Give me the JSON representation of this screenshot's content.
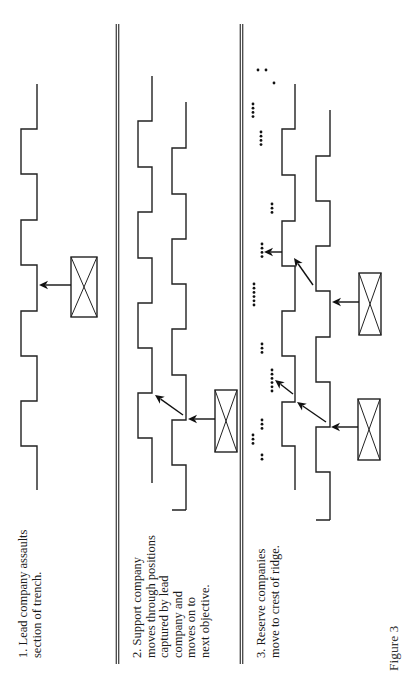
{
  "figure": {
    "label": "Figure 3",
    "colors": {
      "ink": "#222222",
      "background": "#ffffff"
    }
  },
  "panels": [
    {
      "id": 1,
      "caption_lines": [
        "1. Lead company assaults",
        "section of trench."
      ],
      "caption_pos": {
        "x": 17,
        "y": 658
      },
      "trenches": [
        {
          "left_x": 21,
          "right_x": 37,
          "top_y": 84,
          "steps": [
            129,
            174,
            220,
            265,
            311,
            356,
            401,
            446
          ],
          "start_side": "right",
          "end_y": 490,
          "end_stub": null
        }
      ],
      "units": [
        {
          "x": 71,
          "y": 257,
          "w": 26,
          "h": 60
        }
      ],
      "arrows": [
        {
          "x1": 71,
          "y1": 285,
          "x2": 39,
          "y2": 285
        }
      ],
      "dots": []
    },
    {
      "id": 2,
      "caption_lines": [
        "2. Support company",
        "moves through positions",
        "captured by lead",
        "company and",
        "moves on to",
        "next objective."
      ],
      "caption_pos": {
        "x": 131,
        "y": 658
      },
      "trenches": [
        {
          "left_x": 138,
          "right_x": 152,
          "top_y": 76,
          "steps": [
            121,
            167,
            212,
            258,
            303,
            348,
            393,
            438
          ],
          "start_side": "right",
          "end_y": 483,
          "end_stub": null
        },
        {
          "left_x": 172,
          "right_x": 186,
          "top_y": 102,
          "steps": [
            148,
            194,
            239,
            284,
            329,
            375,
            420,
            465,
            510
          ],
          "start_side": "right",
          "end_y": 557,
          "end_stub": "right"
        }
      ],
      "units": [
        {
          "x": 215,
          "y": 390,
          "w": 22,
          "h": 62
        }
      ],
      "arrows": [
        {
          "x1": 215,
          "y1": 419,
          "x2": 188,
          "y2": 419
        },
        {
          "x1": 183,
          "y1": 415,
          "x2": 155,
          "y2": 395
        }
      ],
      "dots": []
    },
    {
      "id": 3,
      "caption_lines": [
        "3. Reserve companies",
        "move to crest of ridge."
      ],
      "caption_pos": {
        "x": 255,
        "y": 658
      },
      "trenches": [
        {
          "left_x": 282,
          "right_x": 295,
          "top_y": 84,
          "steps": [
            129,
            175,
            221,
            266,
            311,
            356,
            402,
            446
          ],
          "start_side": "right",
          "end_y": 490,
          "end_stub": null
        },
        {
          "left_x": 316,
          "right_x": 330,
          "top_y": 110,
          "steps": [
            156,
            201,
            246,
            291,
            337,
            382,
            427,
            472,
            520
          ],
          "start_side": "right",
          "end_y": 565,
          "end_stub": "right"
        }
      ],
      "units": [
        {
          "x": 359,
          "y": 273,
          "w": 22,
          "h": 62
        },
        {
          "x": 358,
          "y": 399,
          "w": 22,
          "h": 61
        }
      ],
      "arrows": [
        {
          "x1": 282,
          "y1": 252,
          "x2": 264,
          "y2": 252
        },
        {
          "x1": 313,
          "y1": 285,
          "x2": 294,
          "y2": 258
        },
        {
          "x1": 359,
          "y1": 302,
          "x2": 332,
          "y2": 302
        },
        {
          "x1": 293,
          "y1": 394,
          "x2": 275,
          "y2": 380
        },
        {
          "x1": 326,
          "y1": 422,
          "x2": 297,
          "y2": 402
        },
        {
          "x1": 358,
          "y1": 427,
          "x2": 331,
          "y2": 427
        }
      ],
      "dots": [
        {
          "x": 258,
          "y": 70,
          "count": 1
        },
        {
          "x": 266,
          "y": 70,
          "count": 1
        },
        {
          "x": 274,
          "y": 83,
          "count": 1
        },
        {
          "x": 253,
          "y": 104,
          "count": 4
        },
        {
          "x": 261,
          "y": 132,
          "count": 4
        },
        {
          "x": 272,
          "y": 204,
          "count": 3
        },
        {
          "x": 262,
          "y": 244,
          "count": 4
        },
        {
          "x": 254,
          "y": 284,
          "count": 6
        },
        {
          "x": 262,
          "y": 344,
          "count": 3
        },
        {
          "x": 272,
          "y": 370,
          "count": 6
        },
        {
          "x": 262,
          "y": 420,
          "count": 3
        },
        {
          "x": 253,
          "y": 435,
          "count": 3
        },
        {
          "x": 262,
          "y": 455,
          "count": 2
        }
      ]
    }
  ],
  "dividers": [
    {
      "x": 117.5,
      "gap": 2.5,
      "y1": 24,
      "y2": 664
    },
    {
      "x": 241.5,
      "gap": 2.5,
      "y1": 24,
      "y2": 664
    }
  ],
  "dot_spacing": 4.2
}
